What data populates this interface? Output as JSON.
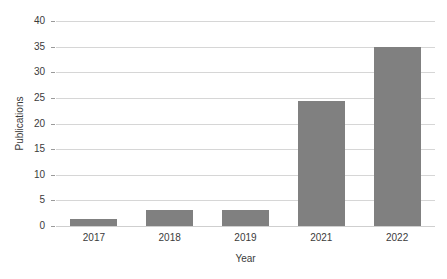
{
  "chart_data": {
    "type": "bar",
    "title": "",
    "subtitle": "",
    "xlabel": "Year",
    "ylabel": "Publications",
    "categories": [
      "2017",
      "2018",
      "2019",
      "2021",
      "2022"
    ],
    "values": [
      1.3,
      3.1,
      3.1,
      24.3,
      35
    ],
    "series": [
      {
        "name": "Publications",
        "values": [
          1.3,
          3.1,
          3.1,
          24.3,
          35
        ]
      }
    ],
    "ylim": [
      0,
      40
    ],
    "yticks": [
      0,
      5,
      10,
      15,
      20,
      25,
      30,
      35,
      40
    ],
    "ytick_labels": [
      "0",
      "5",
      "10",
      "15",
      "20",
      "25",
      "30",
      "35",
      "40"
    ],
    "xtick_labels": [
      "2017",
      "2018",
      "2019",
      "2021",
      "2022"
    ],
    "grid": true,
    "grid_axis": "y",
    "legend": false,
    "legend_position": "none",
    "bar_color": "#808080",
    "grid_color": "#d6d6d6",
    "text_color": "#3b3b3b",
    "background_color": "#ffffff"
  }
}
